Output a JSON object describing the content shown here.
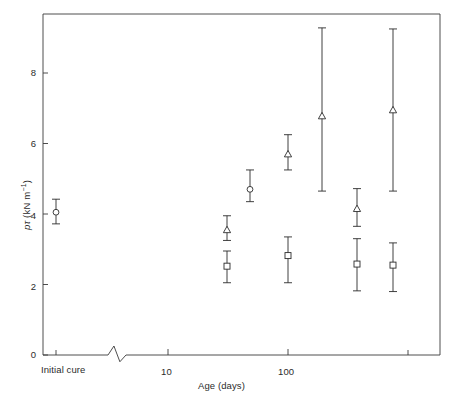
{
  "chart_data": {
    "type": "scatter",
    "title": "",
    "subtitle": "",
    "xlabel": "Age (days)",
    "ylabel": "pτ (kN m⁻¹)",
    "ylabel_parts": {
      "symbol": "pτ",
      "units": "(kN m",
      "exponent": "−1",
      "close": ")"
    },
    "xscale": "log",
    "yscale": "linear",
    "ylim": [
      0,
      9.6
    ],
    "yticks": [
      0,
      2,
      4,
      6,
      8
    ],
    "ytick_labels": [
      "0",
      "2",
      "4",
      "6",
      "8"
    ],
    "xticks": [
      10,
      100
    ],
    "xtick_labels": [
      "10",
      "100"
    ],
    "x_minor_ticks": [
      1000
    ],
    "x_break": {
      "present": true,
      "label_before_break": "Initial cure",
      "note": "axis break between initial cure and log axis"
    },
    "grid": false,
    "legend": {
      "position": "none",
      "entries": []
    },
    "error_bar_style": "vertical with end caps",
    "marker_shapes": {
      "circle": "open circle",
      "triangle": "open triangle-up",
      "square": "open square"
    },
    "series": [
      {
        "name": "circle",
        "marker": "circle",
        "points": [
          {
            "x_label": "Initial cure",
            "x_plot": 56,
            "y": 4.05,
            "y_low": 3.72,
            "y_high": 4.42
          },
          {
            "x_label": "60",
            "x_plot": 250,
            "y": 4.7,
            "y_low": 4.35,
            "y_high": 5.25
          }
        ]
      },
      {
        "name": "triangle",
        "marker": "triangle",
        "points": [
          {
            "x_label": "30",
            "x_plot": 227,
            "y": 3.55,
            "y_low": 3.25,
            "y_high": 3.95
          },
          {
            "x_label": "80",
            "x_plot": 288,
            "y": 5.7,
            "y_low": 5.25,
            "y_high": 6.25
          },
          {
            "x_label": "200",
            "x_plot": 322,
            "y": 6.78,
            "y_low": 4.65,
            "y_high": 9.28
          },
          {
            "x_label": "300",
            "x_plot": 357,
            "y": 4.15,
            "y_low": 3.65,
            "y_high": 4.72
          },
          {
            "x_label": "500",
            "x_plot": 393,
            "y": 6.95,
            "y_low": 4.65,
            "y_high": 9.25
          }
        ]
      },
      {
        "name": "square",
        "marker": "square",
        "points": [
          {
            "x_label": "30",
            "x_plot": 227,
            "y": 2.52,
            "y_low": 2.05,
            "y_high": 2.95
          },
          {
            "x_label": "100",
            "x_plot": 288,
            "y": 2.82,
            "y_low": 2.05,
            "y_high": 3.35
          },
          {
            "x_label": "300",
            "x_plot": 357,
            "y": 2.58,
            "y_low": 1.82,
            "y_high": 3.3
          },
          {
            "x_label": "500",
            "x_plot": 393,
            "y": 2.55,
            "y_low": 1.8,
            "y_high": 3.18
          }
        ]
      }
    ]
  },
  "axis": {
    "y_title_symbol": "pτ",
    "y_title_units": "(kN m",
    "y_title_exp": "−1",
    "y_title_close": ")",
    "x_title": "Age (days)",
    "initial_cure_label": "Initial cure",
    "tick_0": "0",
    "tick_2": "2",
    "tick_4": "4",
    "tick_6": "6",
    "tick_8": "8",
    "tick_10": "10",
    "tick_100": "100"
  },
  "colors": {
    "axis": "#3a3a3a",
    "marker": "#2b2b2b",
    "background": "#ffffff",
    "text": "#2b2b2b"
  }
}
